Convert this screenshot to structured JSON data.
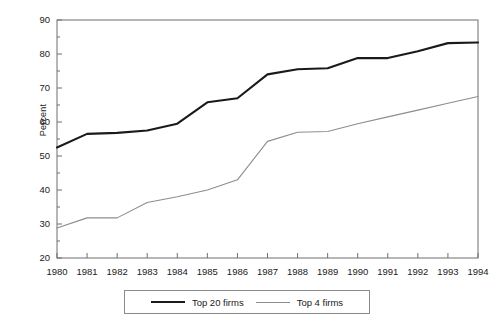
{
  "chart_data": {
    "type": "line",
    "title": "",
    "xlabel": "",
    "ylabel": "Percent",
    "x": [
      1980,
      1981,
      1982,
      1983,
      1984,
      1985,
      1986,
      1987,
      1988,
      1989,
      1990,
      1991,
      1992,
      1993,
      1994
    ],
    "xtick_labels": [
      "1980",
      "1981",
      "1982",
      "1983",
      "1984",
      "1985",
      "1986",
      "1987",
      "1988",
      "1989",
      "1990",
      "1991",
      "1992",
      "1993",
      "1994"
    ],
    "ytick_labels": [
      "20",
      "30",
      "40",
      "50",
      "60",
      "70",
      "80",
      "90"
    ],
    "ytick_values": [
      20,
      30,
      40,
      50,
      60,
      70,
      80,
      90
    ],
    "minor_tick_step": 5,
    "ylim": [
      20,
      90
    ],
    "xlim": [
      1980,
      1994
    ],
    "grid": false,
    "legend_position": "below-center",
    "series": [
      {
        "name": "Top 20 firms",
        "color": "#1a1a1a",
        "width": 2.1,
        "values": [
          52.5,
          56.5,
          56.8,
          57.5,
          59.5,
          65.8,
          67.0,
          74.0,
          75.5,
          75.8,
          78.8,
          78.8,
          80.8,
          83.2,
          83.4
        ]
      },
      {
        "name": "Top 4 firms",
        "color": "#8d8d8d",
        "width": 1.1,
        "values": [
          28.8,
          31.8,
          31.8,
          36.3,
          38.0,
          40.0,
          43.0,
          54.3,
          57.0,
          57.2,
          59.5,
          61.5,
          63.5,
          65.5,
          67.5
        ]
      }
    ]
  },
  "legend": {
    "entries": [
      {
        "label": "Top 20 firms",
        "style": "thick"
      },
      {
        "label": "Top 4 firms",
        "style": "thin"
      }
    ]
  }
}
